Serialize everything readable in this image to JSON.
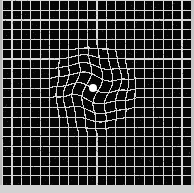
{
  "figure": {
    "name": "amsler-grid",
    "width": 194,
    "height": 193
  },
  "colors": {
    "background": "#050505",
    "grid_line": "#d8d8d8",
    "fixation_dot": "#ffffff",
    "frame": "#c9c9c9",
    "bottom_band": "#d2d2d2"
  },
  "grid": {
    "panel": {
      "x": 2,
      "y": 0,
      "width": 189,
      "height": 185
    },
    "columns": 20,
    "rows": 19,
    "cell_width": 9.45,
    "cell_height": 9.74,
    "line_width": 1.15,
    "line_color": "#d8d8d8"
  },
  "fixation_dot": {
    "label": "central fixation dot",
    "cx": 93,
    "cy": 88,
    "radius": 4.2,
    "color": "#ffffff"
  },
  "distortion": {
    "label": "metamorphopsia warp region",
    "center_x": 93,
    "center_y": 89,
    "radius": 44,
    "swirl_strength": 0.55,
    "bulge_strength": 0.42,
    "wave_amplitude": 2.6,
    "wave_frequency": 2.4
  },
  "chart_data": {
    "type": "heatmap",
    "xlabel": "",
    "ylabel": "",
    "categories": [],
    "values": [],
    "grid": true,
    "legend_position": "none"
  }
}
